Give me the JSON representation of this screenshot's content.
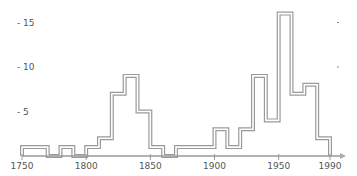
{
  "chart_data": {
    "type": "bar",
    "subtype": "step-histogram",
    "title": "",
    "xlabel": "",
    "ylabel": "",
    "xlim": [
      1750,
      1990
    ],
    "ylim": [
      0,
      17
    ],
    "grid": false,
    "legend": null,
    "x_ticks": [
      "1750",
      "1800",
      "1850",
      "1900",
      "1950",
      "1990"
    ],
    "y_ticks": [
      "5",
      "10",
      "15"
    ],
    "bins": [
      {
        "start": 1750,
        "end": 1770,
        "value": 1
      },
      {
        "start": 1770,
        "end": 1780,
        "value": 0
      },
      {
        "start": 1780,
        "end": 1790,
        "value": 1
      },
      {
        "start": 1790,
        "end": 1800,
        "value": 0
      },
      {
        "start": 1800,
        "end": 1810,
        "value": 1
      },
      {
        "start": 1810,
        "end": 1820,
        "value": 2
      },
      {
        "start": 1820,
        "end": 1830,
        "value": 7
      },
      {
        "start": 1830,
        "end": 1840,
        "value": 9
      },
      {
        "start": 1840,
        "end": 1850,
        "value": 5
      },
      {
        "start": 1850,
        "end": 1860,
        "value": 1
      },
      {
        "start": 1860,
        "end": 1870,
        "value": 0
      },
      {
        "start": 1870,
        "end": 1900,
        "value": 1
      },
      {
        "start": 1900,
        "end": 1910,
        "value": 3
      },
      {
        "start": 1910,
        "end": 1920,
        "value": 1
      },
      {
        "start": 1920,
        "end": 1930,
        "value": 3
      },
      {
        "start": 1930,
        "end": 1940,
        "value": 9
      },
      {
        "start": 1940,
        "end": 1950,
        "value": 4
      },
      {
        "start": 1950,
        "end": 1960,
        "value": 16
      },
      {
        "start": 1960,
        "end": 1970,
        "value": 7
      },
      {
        "start": 1970,
        "end": 1980,
        "value": 8
      },
      {
        "start": 1980,
        "end": 1990,
        "value": 2
      }
    ],
    "colors": {
      "line": "#9a9a9a",
      "inner": "#ffffff",
      "axis": "#999999",
      "text": "#555555"
    }
  }
}
